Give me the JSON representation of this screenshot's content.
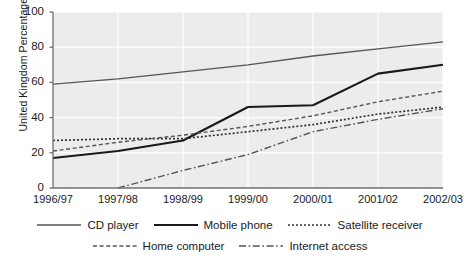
{
  "chart_data": {
    "type": "line",
    "title": "",
    "xlabel": "",
    "ylabel": "United Kingdom Percentages",
    "categories": [
      "1996/97",
      "1997/98",
      "1998/99",
      "1999/00",
      "2000/01",
      "2001/02",
      "2002/03"
    ],
    "yticks": [
      0,
      20,
      40,
      60,
      80,
      100
    ],
    "ylim": [
      0,
      100
    ],
    "grid": true,
    "legend_position": "bottom",
    "series": [
      {
        "name": "CD player",
        "style": "solid-thin",
        "color": "#555555",
        "values": [
          59,
          62,
          66,
          70,
          75,
          79,
          83
        ]
      },
      {
        "name": "Mobile phone",
        "style": "solid-thick",
        "color": "#1a1a1a",
        "values": [
          17,
          21,
          27,
          46,
          47,
          65,
          70
        ]
      },
      {
        "name": "Satellite receiver",
        "style": "dotted",
        "color": "#333333",
        "values": [
          27,
          28,
          28,
          32,
          36,
          42,
          46
        ]
      },
      {
        "name": "Home computer",
        "style": "dashed",
        "color": "#555555",
        "values": [
          21,
          26,
          30,
          35,
          41,
          49,
          55
        ]
      },
      {
        "name": "Internet access",
        "style": "dash-dot",
        "color": "#555555",
        "values": [
          null,
          0,
          10,
          19,
          32,
          39,
          45
        ]
      }
    ]
  },
  "legend": {
    "row1": [
      {
        "label": "CD player",
        "style": "solid-thin"
      },
      {
        "label": "Mobile phone",
        "style": "solid-thick"
      },
      {
        "label": "Satellite receiver",
        "style": "dotted"
      }
    ],
    "row2": [
      {
        "label": "Home computer",
        "style": "dashed"
      },
      {
        "label": "Internet access",
        "style": "dash-dot"
      }
    ]
  },
  "colors": {
    "plot_background": "#ececec",
    "gridline": "#ffffff",
    "axis": "#6f6f6f",
    "text": "#1a1a1a"
  }
}
